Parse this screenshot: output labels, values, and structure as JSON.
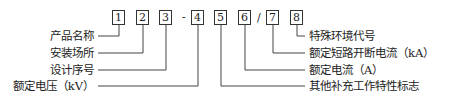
{
  "diagram": {
    "boxes": [
      "1",
      "2",
      "3",
      "4",
      "5",
      "6",
      "7",
      "8"
    ],
    "separators": {
      "dash": "-",
      "slash": "/"
    },
    "left_labels": [
      "产品名称",
      "安装场所",
      "设计序号",
      "额定电压（kV）"
    ],
    "right_labels": [
      "特殊环境代号",
      "额定短路开断电流（kA）",
      "额定电流（A）",
      "其他补充工作特性标志"
    ]
  }
}
